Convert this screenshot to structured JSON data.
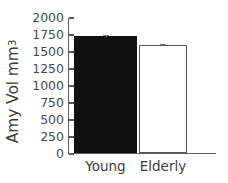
{
  "chart_data": {
    "type": "bar",
    "title": "",
    "xlabel": "",
    "ylabel_text": "Amy Vol mm",
    "ylabel_exponent": "3",
    "categories": [
      "Young",
      "Elderly"
    ],
    "values": [
      1720,
      1590
    ],
    "errors": [
      30,
      35
    ],
    "series": [
      {
        "name": "Amygdala Volume",
        "values": [
          1720,
          1590
        ]
      }
    ],
    "ylim": [
      0,
      2000
    ],
    "ytick_values": [
      0,
      250,
      500,
      750,
      1000,
      1250,
      1500,
      1750,
      2000
    ],
    "ytick_labels": [
      "0",
      "250",
      "500",
      "750",
      "1000",
      "1250",
      "1500",
      "1750",
      "2000"
    ],
    "grid": false,
    "legend": "none",
    "bar_styles": [
      {
        "fill": "#111111",
        "edge": "#111111",
        "name": "filled"
      },
      {
        "fill": "#ffffff",
        "edge": "#555555",
        "name": "hollow"
      }
    ],
    "colors": {
      "axis": "#5b5b5b",
      "text": "#3d3d3d",
      "young_bar": "#111111",
      "elderly_bar": "#ffffff",
      "error_bar": "#777777"
    }
  }
}
